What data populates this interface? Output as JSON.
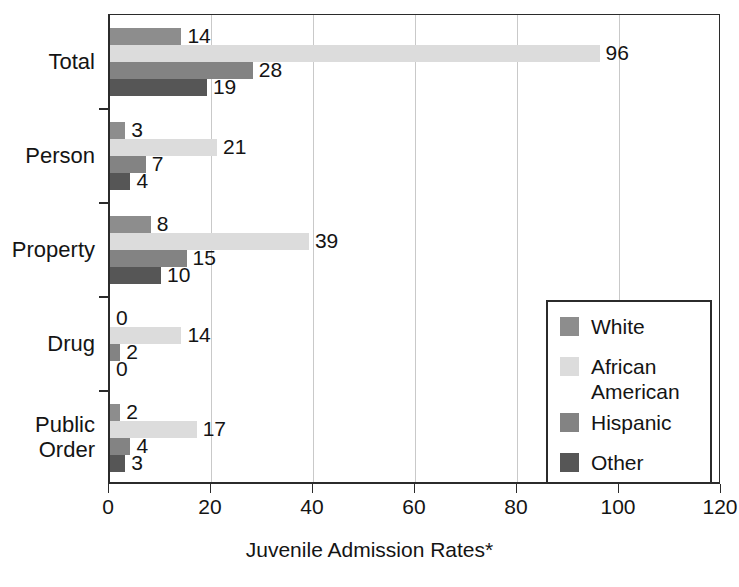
{
  "chart_data": {
    "type": "bar",
    "orientation": "horizontal",
    "title": "",
    "xlabel": "Juvenile Admission Rates*",
    "ylabel": "",
    "xlim": [
      0,
      120
    ],
    "xticks": [
      0,
      20,
      40,
      60,
      80,
      100,
      120
    ],
    "xtick_labels": [
      "0",
      "20",
      "40",
      "60",
      "80",
      "100",
      "120"
    ],
    "grid": true,
    "grid_axis": "x",
    "legend_position": "center-right",
    "categories": [
      "Total",
      "Person",
      "Property",
      "Drug",
      "Public\nOrder"
    ],
    "series": [
      {
        "name": "White",
        "color": "#8d8d8d",
        "values": [
          14,
          3,
          8,
          0,
          2
        ]
      },
      {
        "name": "African\nAmerican",
        "color": "#dcdcdc",
        "values": [
          96,
          21,
          39,
          14,
          17
        ]
      },
      {
        "name": "Hispanic",
        "color": "#838383",
        "values": [
          28,
          7,
          15,
          2,
          4
        ]
      },
      {
        "name": "Other",
        "color": "#565656",
        "values": [
          19,
          4,
          10,
          0,
          3
        ]
      }
    ],
    "data_labels": {
      "Total": {
        "White": "14",
        "African American": "96",
        "Hispanic": "28",
        "Other": "19"
      },
      "Person": {
        "White": "3",
        "African American": "21",
        "Hispanic": "7",
        "Other": "4"
      },
      "Property": {
        "White": "8",
        "African American": "39",
        "Hispanic": "15",
        "Other": "10"
      },
      "Drug": {
        "White": "0",
        "African American": "14",
        "Hispanic": "2",
        "Other": "0"
      },
      "Public Order": {
        "White": "2",
        "African American": "17",
        "Hispanic": "4",
        "Other": "3"
      }
    }
  },
  "legend": {
    "items": [
      {
        "label": "White",
        "color": "#8d8d8d"
      },
      {
        "label": "African\nAmerican",
        "color": "#dcdcdc"
      },
      {
        "label": "Hispanic",
        "color": "#838383"
      },
      {
        "label": "Other",
        "color": "#565656"
      }
    ]
  },
  "axis": {
    "x_title": "Juvenile Admission Rates*",
    "x_tick_labels": [
      "0",
      "20",
      "40",
      "60",
      "80",
      "100",
      "120"
    ],
    "y_category_labels": [
      "Total",
      "Person",
      "Property",
      "Drug",
      "Public\nOrder"
    ]
  }
}
